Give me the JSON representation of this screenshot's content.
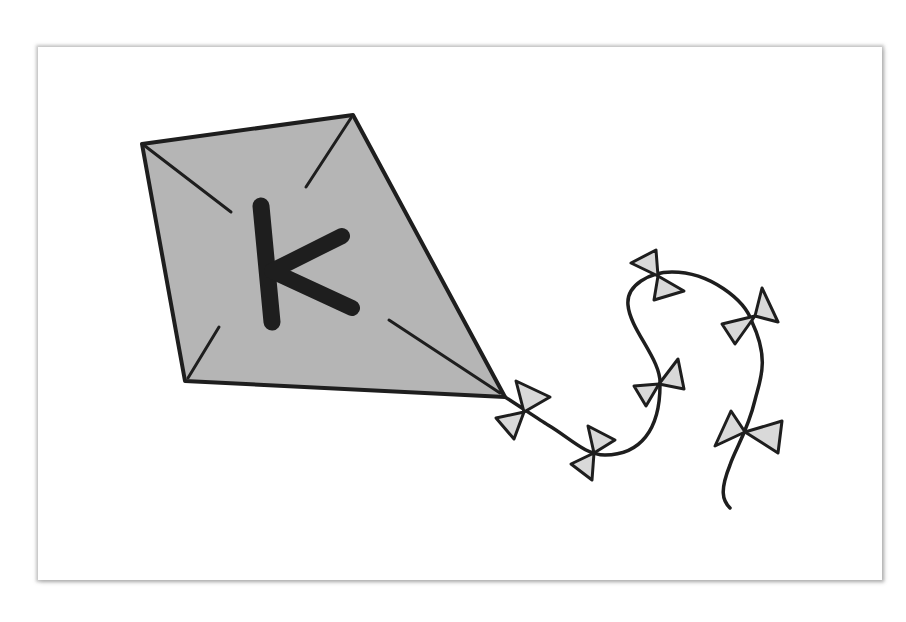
{
  "illustration": {
    "subject": "kite",
    "letter": "K",
    "bow_count": 8,
    "colors": {
      "background": "#ffffff",
      "card": "#ffffff",
      "kite_fill": "#b5b5b5",
      "bow_fill": "#d9d9d9",
      "ink": "#1e1e1e"
    }
  }
}
